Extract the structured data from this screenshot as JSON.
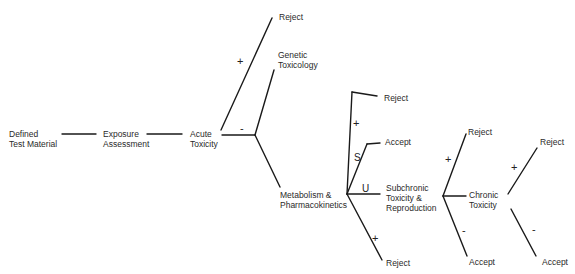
{
  "diagram": {
    "type": "decision-tree",
    "nodes": {
      "defined_test_material": "Defined\nTest Material",
      "exposure_assessment": "Exposure\nAssessment",
      "acute_toxicity": "Acute\nToxicity",
      "reject_1": "Reject",
      "genetic_toxicology": "Genetic\nToxicology",
      "metabolism": "Metabolism &\nPharmacokinetics",
      "reject_2": "Reject",
      "accept_1": "Accept",
      "subchronic": "Subchronic\nToxicity &\nReproduction",
      "reject_3": "Reject",
      "reject_4": "Reject",
      "chronic_toxicity": "Chronic\nToxicity",
      "accept_2": "Accept",
      "reject_5": "Reject",
      "accept_3": "Accept"
    },
    "edge_labels": {
      "acute_plus": "+",
      "acute_minus": "-",
      "meta_plus_top": "+",
      "meta_s": "S",
      "meta_u": "U",
      "meta_plus_bottom": "+",
      "sub_plus": "+",
      "sub_minus": "-",
      "chronic_plus": "+",
      "chronic_minus": "-"
    },
    "line_color": "#1a1a1a"
  }
}
